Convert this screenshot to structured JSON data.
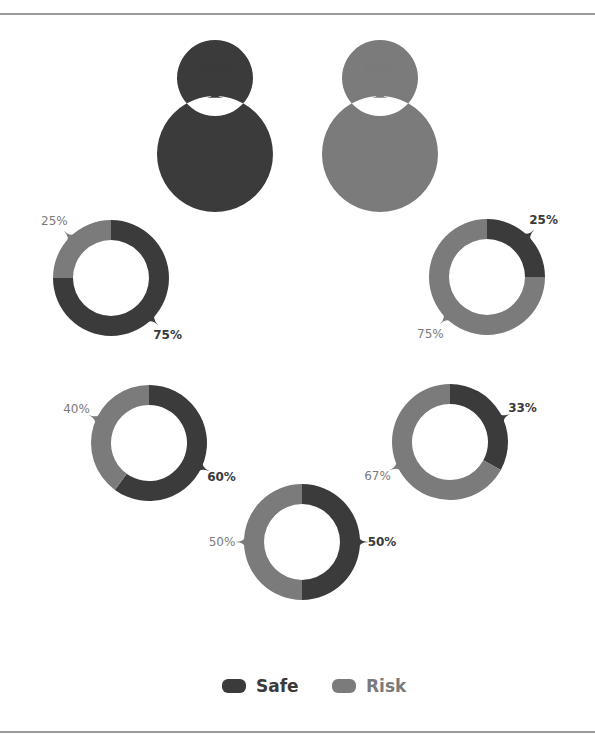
{
  "colors": {
    "safe": "#3b3b3b",
    "risk": "#7b7b7b",
    "label_safe": "#3a3a3a",
    "label_risk": "#7a7a7a",
    "frame": "#9a9a9a"
  },
  "legend": {
    "items": [
      {
        "key": "safe",
        "label": "Safe"
      },
      {
        "key": "risk",
        "label": "Risk"
      }
    ]
  },
  "chart_data": {
    "type": "pie",
    "subtype": "donut-small-multiples",
    "title": "",
    "legend_position": "bottom",
    "series_names": [
      "Safe",
      "Risk"
    ],
    "charts": [
      {
        "id": "d1",
        "safe": 100,
        "risk": 0,
        "safe_label": "100%",
        "risk_label": "",
        "cx": 215,
        "cy": 154
      },
      {
        "id": "d2",
        "safe": 0,
        "risk": 100,
        "safe_label": "",
        "risk_label": "100%",
        "cx": 380,
        "cy": 154
      },
      {
        "id": "d3",
        "safe": 75,
        "risk": 25,
        "safe_label": "75%",
        "risk_label": "25%",
        "cx": 111,
        "cy": 278
      },
      {
        "id": "d4",
        "safe": 25,
        "risk": 75,
        "safe_label": "25%",
        "risk_label": "75%",
        "cx": 487,
        "cy": 277
      },
      {
        "id": "d5",
        "safe": 60,
        "risk": 40,
        "safe_label": "60%",
        "risk_label": "40%",
        "cx": 149,
        "cy": 443
      },
      {
        "id": "d6",
        "safe": 33,
        "risk": 67,
        "safe_label": "33%",
        "risk_label": "67%",
        "cx": 450,
        "cy": 442
      },
      {
        "id": "d7",
        "safe": 50,
        "risk": 50,
        "safe_label": "50%",
        "risk_label": "50%",
        "cx": 302,
        "cy": 542
      }
    ]
  }
}
